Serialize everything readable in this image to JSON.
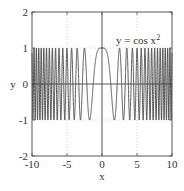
{
  "chart_data": {
    "type": "line",
    "title": "",
    "annotation": "y = cos x²",
    "annotation_text": "y = cos x",
    "annotation_sup": "2",
    "xlabel": "x",
    "ylabel": "y",
    "xlim": [
      -10,
      10
    ],
    "ylim": [
      -2,
      2
    ],
    "xticks": [
      "-10",
      "-5",
      "0",
      "5",
      "10"
    ],
    "yticks": [
      "2",
      "1",
      "0",
      "-1",
      "-2"
    ],
    "grid": true,
    "function": "cos(x^2)",
    "series": [
      {
        "name": "y = cos x^2",
        "color": "#444444",
        "x_range": [
          -10,
          10
        ],
        "samples": 4000
      }
    ]
  },
  "colors": {
    "line": "#444444",
    "axis": "#555555",
    "grid": "#bbbbbb"
  }
}
